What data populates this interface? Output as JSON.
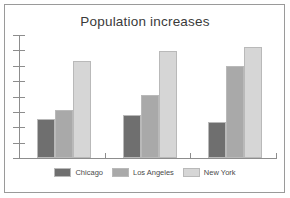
{
  "chart_data": {
    "type": "bar",
    "title": "Population increases",
    "xlabel": "",
    "ylabel": "",
    "categories": [
      "Group 1",
      "Group 2",
      "Group 3"
    ],
    "series": [
      {
        "name": "Chicago",
        "color": "#6f6f6f",
        "values": [
          32,
          35,
          29
        ]
      },
      {
        "name": "Los Angeles",
        "color": "#a9a9a9",
        "values": [
          39,
          51,
          75
        ]
      },
      {
        "name": "New York",
        "color": "#d6d6d6",
        "values": [
          79,
          87,
          90
        ]
      }
    ],
    "ylim": [
      0,
      100
    ],
    "grid": false,
    "legend_position": "bottom",
    "y_tick_count": 9,
    "y_tick_labels": [],
    "x_tick_labels": []
  },
  "legend": {
    "entries": [
      {
        "label": "Chicago"
      },
      {
        "label": "Los Angeles"
      },
      {
        "label": "New York"
      }
    ]
  },
  "colors": {
    "frame": "#9a9a9a",
    "axis": "#8d8d8d",
    "background": "#ffffff",
    "title_text": "#3a3a3a",
    "legend_text": "#4a4a4a",
    "bar_outline": "#b9b9b9"
  }
}
